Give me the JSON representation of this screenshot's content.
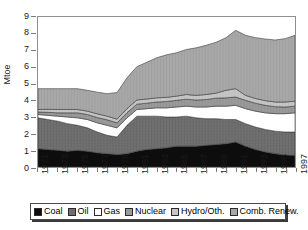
{
  "chart_data": {
    "type": "area",
    "stacked": true,
    "title": "",
    "xlabel": "",
    "ylabel": "Mtoe",
    "ylim": [
      0,
      9
    ],
    "yticks": [
      0,
      1,
      2,
      3,
      4,
      5,
      6,
      7,
      8,
      9
    ],
    "grid": false,
    "legend_position": "bottom",
    "x": [
      1971,
      1972,
      1973,
      1974,
      1975,
      1976,
      1977,
      1978,
      1979,
      1980,
      1981,
      1982,
      1983,
      1984,
      1985,
      1986,
      1987,
      1988,
      1989,
      1990,
      1991,
      1992,
      1993,
      1994,
      1995,
      1996,
      1997
    ],
    "tick_labels": [
      "1971",
      "1973",
      "1975",
      "1977",
      "1979",
      "1981",
      "1983",
      "1985",
      "1987",
      "1989",
      "1991",
      "1993",
      "1995",
      "1997"
    ],
    "series": [
      {
        "name": "Coal",
        "color": "#0d0d0d",
        "values": [
          1.1,
          1.05,
          1.0,
          0.95,
          1.0,
          0.95,
          0.85,
          0.8,
          0.75,
          0.8,
          0.95,
          1.05,
          1.1,
          1.15,
          1.25,
          1.25,
          1.25,
          1.3,
          1.35,
          1.4,
          1.5,
          1.25,
          1.05,
          0.9,
          0.8,
          0.72,
          0.7
        ]
      },
      {
        "name": "Oil",
        "color": "#6e6e6e",
        "values": [
          1.85,
          1.8,
          1.75,
          1.65,
          1.5,
          1.4,
          1.25,
          1.1,
          1.05,
          1.7,
          2.1,
          2.0,
          1.95,
          1.85,
          1.75,
          1.8,
          1.7,
          1.6,
          1.55,
          1.45,
          1.35,
          1.35,
          1.35,
          1.35,
          1.35,
          1.38,
          1.4
        ]
      },
      {
        "name": "Gas",
        "color": "#ffffff",
        "values": [
          0.2,
          0.25,
          0.3,
          0.4,
          0.45,
          0.5,
          0.55,
          0.6,
          0.55,
          0.45,
          0.4,
          0.45,
          0.5,
          0.55,
          0.6,
          0.6,
          0.65,
          0.7,
          0.75,
          0.8,
          0.85,
          0.9,
          0.95,
          1.0,
          1.05,
          1.1,
          1.15
        ]
      },
      {
        "name": "Nuclear",
        "color": "#9a9a9a",
        "values": [
          0.15,
          0.18,
          0.2,
          0.25,
          0.3,
          0.3,
          0.32,
          0.33,
          0.3,
          0.3,
          0.32,
          0.33,
          0.35,
          0.38,
          0.4,
          0.42,
          0.42,
          0.45,
          0.48,
          0.5,
          0.5,
          0.5,
          0.48,
          0.45,
          0.42,
          0.4,
          0.4
        ]
      },
      {
        "name": "Hydro/Oth.",
        "color": "#c6c6c6",
        "values": [
          0.15,
          0.18,
          0.2,
          0.2,
          0.2,
          0.2,
          0.22,
          0.22,
          0.22,
          0.25,
          0.25,
          0.25,
          0.25,
          0.25,
          0.25,
          0.28,
          0.28,
          0.3,
          0.3,
          0.45,
          0.5,
          0.3,
          0.28,
          0.28,
          0.28,
          0.3,
          0.3
        ]
      },
      {
        "name": "Comb. Renew.",
        "color": "#a8a8a8",
        "values": [
          1.25,
          1.24,
          1.25,
          1.25,
          1.25,
          1.25,
          1.3,
          1.35,
          1.6,
          1.85,
          2.0,
          2.2,
          2.4,
          2.55,
          2.6,
          2.7,
          2.85,
          2.95,
          3.05,
          3.15,
          3.5,
          3.6,
          3.65,
          3.7,
          3.72,
          3.8,
          3.95
        ]
      }
    ],
    "totals": [
      4.7,
      4.7,
      4.7,
      4.7,
      4.7,
      4.6,
      4.49,
      4.4,
      4.47,
      5.35,
      6.02,
      6.28,
      6.55,
      6.73,
      6.85,
      7.05,
      7.15,
      7.3,
      7.48,
      7.75,
      8.2,
      7.9,
      7.76,
      7.68,
      7.62,
      7.7,
      7.9
    ]
  },
  "legend": {
    "items": [
      {
        "label": "Coal"
      },
      {
        "label": "Oil"
      },
      {
        "label": "Gas"
      },
      {
        "label": "Nuclear"
      },
      {
        "label": "Hydro/Oth."
      },
      {
        "label": "Comb. Renew."
      }
    ]
  },
  "axes": {
    "y_label": "Mtoe"
  }
}
